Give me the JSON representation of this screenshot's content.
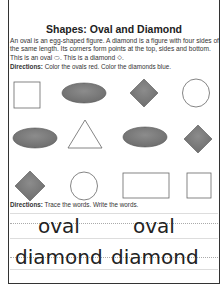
{
  "worksheet": {
    "title": "Shapes: Oval and Diamond",
    "intro": "An oval is an egg-shaped figure.  A diamond is a figure with four sides of the same length. Its corners form points at the top, sides and bottom. This is an oval ⬭. This is a diamond ◇.",
    "directions1": {
      "label": "Directions:",
      "text": " Color the ovals red. Color the diamonds blue."
    },
    "shapes": [
      [
        "square",
        "oval-filled",
        "diamond-filled",
        "circle"
      ],
      [
        "oval-filled",
        "triangle",
        "oval-filled",
        "diamond-filled"
      ],
      [
        "diamond-filled",
        "circle",
        "rectangle",
        "square"
      ]
    ],
    "directions2": {
      "label": "Directions:",
      "text": " Trace the words. Write the words."
    },
    "trace_words": {
      "row1": [
        "oval",
        "oval"
      ],
      "row2": [
        "diamond",
        "diamond"
      ]
    },
    "colors": {
      "fill": "#7a7a7a",
      "stroke": "#555555",
      "border": "#333333"
    }
  }
}
